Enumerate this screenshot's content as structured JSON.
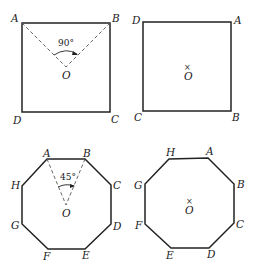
{
  "figures": [
    {
      "id": "square-rotation-demo",
      "shape": "square",
      "vertices": {
        "A": [
          22,
          23
        ],
        "B": [
          110,
          23
        ],
        "C": [
          110,
          112
        ],
        "D": [
          22,
          112
        ]
      },
      "labels": {
        "A": "A",
        "B": "B",
        "C": "C",
        "D": "D",
        "O": "O"
      },
      "center": [
        66,
        67
      ],
      "central_angle": "90°",
      "dashed_radii": [
        "OA",
        "OB"
      ]
    },
    {
      "id": "square-rotated",
      "shape": "square",
      "vertices": {
        "D": [
          143,
          22
        ],
        "A": [
          231,
          22
        ],
        "B": [
          231,
          111
        ],
        "C": [
          143,
          111
        ]
      },
      "labels": {
        "A": "A",
        "B": "B",
        "C": "C",
        "D": "D",
        "O": "O"
      },
      "center_mark": "×",
      "center": [
        187,
        67
      ]
    },
    {
      "id": "octagon-rotation-demo",
      "shape": "regular octagon",
      "labels": {
        "A": "A",
        "B": "B",
        "C": "C",
        "D": "D",
        "E": "E",
        "F": "F",
        "G": "G",
        "H": "H",
        "O": "O"
      },
      "central_angle": "45°",
      "dashed_radii": [
        "OA",
        "OB"
      ]
    },
    {
      "id": "octagon-rotated",
      "shape": "regular octagon",
      "labels": {
        "A": "A",
        "B": "B",
        "C": "C",
        "D": "D",
        "E": "E",
        "F": "F",
        "G": "G",
        "H": "H",
        "O": "O"
      },
      "center_mark": "×"
    }
  ]
}
